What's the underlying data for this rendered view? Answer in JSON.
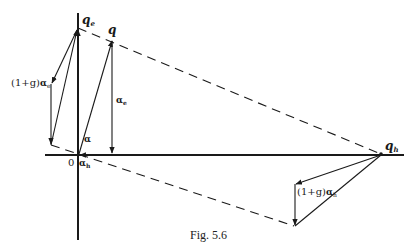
{
  "figure": {
    "caption": "Fig. 5.6",
    "labels": {
      "q_e": "q",
      "q_e_sub": "e",
      "q": "q",
      "q_h": "q",
      "q_h_sub": "h",
      "alpha_e": "α",
      "alpha_e_sub": "e",
      "alpha": "α",
      "alpha_h": "α",
      "alpha_h_sub": "h",
      "origin": "0",
      "one_plus_g_alpha_e_prefix": "(1+g)",
      "one_plus_g_alpha_e": "α",
      "one_plus_g_alpha_e_sub": "e",
      "one_plus_g_alpha_h_prefix": "(1+g)",
      "one_plus_g_alpha_h": "α",
      "one_plus_g_alpha_h_sub": "h"
    },
    "colors": {
      "ink": "#1a1a1a",
      "background": "#ffffff"
    }
  }
}
